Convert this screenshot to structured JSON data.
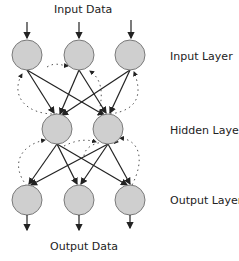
{
  "diagram": {
    "title_top": "Input Data",
    "title_bottom": "Output Data",
    "layers": [
      {
        "name": "Input Layer",
        "nodes": 3
      },
      {
        "name": "Hidden Layer",
        "nodes": 2
      },
      {
        "name": "Output Layer",
        "nodes": 3
      }
    ],
    "colors": {
      "node_fill": "#cfcfcf",
      "node_stroke": "#7a7a7a",
      "edge": "#222222",
      "recurrent_edge": "#555555"
    },
    "edges": {
      "feedforward": "solid arrows, fully connected between adjacent layers",
      "recurrent": "dotted curved arrows (feedback connections)"
    }
  }
}
